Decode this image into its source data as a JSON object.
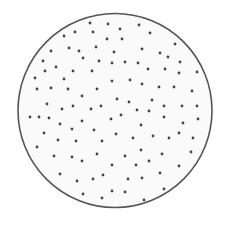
{
  "diagram": {
    "circle": {
      "cx": 115,
      "cy": 110.5,
      "r": 97,
      "stroke": "#555555",
      "fill": "#fafafa",
      "stroke_width": 1.6
    },
    "dot_style": {
      "r": 1.4,
      "fill": "#444444"
    },
    "dots": [
      [
        90,
        23
      ],
      [
        108,
        24
      ],
      [
        64,
        36
      ],
      [
        75,
        32
      ],
      [
        93,
        32
      ],
      [
        107,
        39
      ],
      [
        51,
        51
      ],
      [
        69,
        48
      ],
      [
        79,
        51
      ],
      [
        96,
        47
      ],
      [
        114,
        52
      ],
      [
        43,
        61
      ],
      [
        83,
        58
      ],
      [
        99,
        61
      ],
      [
        112,
        63
      ],
      [
        56,
        67
      ],
      [
        45,
        71
      ],
      [
        73,
        71
      ],
      [
        92,
        71
      ],
      [
        35,
        78
      ],
      [
        64,
        79
      ],
      [
        112,
        81
      ],
      [
        37,
        89
      ],
      [
        51,
        88
      ],
      [
        68,
        89
      ],
      [
        97,
        89
      ],
      [
        82,
        96
      ],
      [
        47,
        104
      ],
      [
        62,
        109
      ],
      [
        73,
        106
      ],
      [
        91,
        109
      ],
      [
        101,
        106
      ],
      [
        120,
        29
      ],
      [
        139,
        25
      ],
      [
        150,
        33
      ],
      [
        122,
        39
      ],
      [
        175,
        44
      ],
      [
        142,
        49
      ],
      [
        160,
        53
      ],
      [
        168,
        57
      ],
      [
        125,
        62
      ],
      [
        138,
        63
      ],
      [
        180,
        62
      ],
      [
        148,
        69
      ],
      [
        165,
        69
      ],
      [
        179,
        73
      ],
      [
        197,
        72
      ],
      [
        130,
        80
      ],
      [
        142,
        84
      ],
      [
        159,
        87
      ],
      [
        174,
        87
      ],
      [
        192,
        91
      ],
      [
        117,
        99
      ],
      [
        129,
        102
      ],
      [
        152,
        100
      ],
      [
        164,
        106
      ],
      [
        182,
        106
      ],
      [
        197,
        106
      ],
      [
        137,
        110
      ],
      [
        149,
        111
      ],
      [
        30,
        117
      ],
      [
        39,
        117
      ],
      [
        49,
        118
      ],
      [
        60,
        124
      ],
      [
        72,
        129
      ],
      [
        82,
        121
      ],
      [
        94,
        130
      ],
      [
        111,
        119
      ],
      [
        44,
        133
      ],
      [
        58,
        140
      ],
      [
        76,
        141
      ],
      [
        102,
        141
      ],
      [
        37,
        147
      ],
      [
        54,
        156
      ],
      [
        72,
        157
      ],
      [
        82,
        161
      ],
      [
        97,
        154
      ],
      [
        112,
        165
      ],
      [
        60,
        174
      ],
      [
        77,
        181
      ],
      [
        103,
        175
      ],
      [
        93,
        179
      ],
      [
        83,
        194
      ],
      [
        102,
        198
      ],
      [
        112,
        191
      ],
      [
        121,
        115
      ],
      [
        164,
        117
      ],
      [
        198,
        119
      ],
      [
        141,
        125
      ],
      [
        183,
        123
      ],
      [
        116,
        134
      ],
      [
        133,
        138
      ],
      [
        153,
        136
      ],
      [
        169,
        138
      ],
      [
        179,
        133
      ],
      [
        193,
        138
      ],
      [
        141,
        150
      ],
      [
        191,
        152
      ],
      [
        125,
        156
      ],
      [
        162,
        154
      ],
      [
        149,
        161
      ],
      [
        136,
        165
      ],
      [
        179,
        166
      ],
      [
        160,
        173
      ],
      [
        128,
        179
      ],
      [
        142,
        178
      ],
      [
        164,
        189
      ],
      [
        125,
        192
      ],
      [
        144,
        200
      ]
    ]
  }
}
